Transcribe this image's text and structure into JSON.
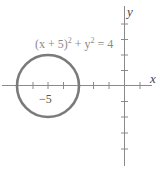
{
  "diagram": {
    "type": "coordinate-plane-circle",
    "equation": {
      "lhs_base1": "(x + 5)",
      "exp1": "2",
      "plus": " + y",
      "exp2": "2",
      "rhs": " = 4"
    },
    "axes": {
      "x_label": "x",
      "y_label": "y"
    },
    "tick_label": "−5",
    "circle": {
      "center": [
        -5,
        0
      ],
      "radius": 2
    },
    "colors": {
      "axis": "#8a8a8a",
      "circle": "#7a7a7a",
      "text": "#8a8a8a"
    },
    "x_ticks": [
      -7,
      -6,
      -5,
      -4,
      -3,
      -2,
      -1,
      1
    ],
    "y_ticks": [
      4,
      3,
      2,
      1,
      -1,
      -2,
      -3,
      -4,
      -5
    ]
  }
}
